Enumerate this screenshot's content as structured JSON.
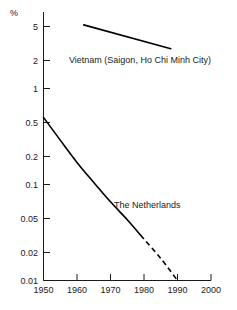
{
  "chart_data": {
    "type": "line",
    "title": "",
    "xlabel": "",
    "ylabel": "%",
    "yscale": "log",
    "xlim": [
      1950,
      2000
    ],
    "ylim": [
      0.01,
      7
    ],
    "grid": false,
    "legend": "inline-annotations",
    "x_ticks": [
      "1950",
      "1960",
      "1970",
      "1980",
      "1990",
      "2000"
    ],
    "x_tick_values": [
      1950,
      1960,
      1970,
      1980,
      1990,
      2000
    ],
    "y_ticks": [
      "5",
      "2",
      "1",
      "0.5",
      "0.2",
      "0.1",
      "0.05",
      "0.02",
      "0.01"
    ],
    "y_tick_values": [
      5,
      2,
      1,
      0.5,
      0.2,
      0.1,
      0.05,
      0.02,
      0.01
    ],
    "series": [
      {
        "name": "Vietnam (Saigon, Ho Chi Minh City)",
        "style": "solid",
        "x": [
          1962,
          1988
        ],
        "values": [
          4.6,
          2.6
        ]
      },
      {
        "name": "The Netherlands",
        "style": "solid-then-dashed",
        "x": [
          1950,
          1955,
          1960,
          1965,
          1970,
          1975,
          1980,
          1985,
          1990
        ],
        "values": [
          0.5,
          0.29,
          0.17,
          0.105,
          0.066,
          0.043,
          0.027,
          0.017,
          0.01
        ],
        "dashed_from": 1979
      }
    ],
    "annotations": [
      {
        "text": "Vietnam (Saigon, Ho Chi Minh City)",
        "x": 1963,
        "y": 2.1
      },
      {
        "text": "The Netherlands",
        "x": 1977,
        "y": 0.055
      }
    ]
  },
  "axis": {
    "unit": "%"
  },
  "colors": {
    "ink": "#1a1a1a",
    "line": "#000000",
    "background": "#ffffff"
  }
}
